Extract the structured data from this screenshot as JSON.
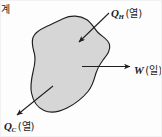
{
  "figure": {
    "background_color": "#fdfdfd",
    "border_color": "#f2f2f2"
  },
  "system": {
    "label": "계",
    "fill_color": "#d6d6d6",
    "stroke_color": "#1f1f1f"
  },
  "flows": {
    "heat_in": {
      "symbol": "Q",
      "subscript": "H",
      "unit_note": "(열)",
      "direction": "into-system",
      "arrow_color": "#1f1f1f"
    },
    "work_out": {
      "symbol": "W",
      "subscript": "",
      "unit_note": "(일)",
      "direction": "out-of-system",
      "arrow_color": "#1f1f1f"
    },
    "heat_out": {
      "symbol": "Q",
      "subscript": "C",
      "unit_note": "(열)",
      "direction": "out-of-system",
      "arrow_color": "#1f1f1f"
    }
  }
}
